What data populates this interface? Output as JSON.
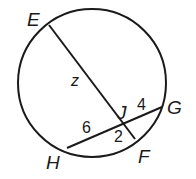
{
  "diagram": {
    "type": "circle-intersecting-chords",
    "points": {
      "E": {
        "label": "E",
        "x": 49,
        "y": 25
      },
      "F": {
        "label": "F",
        "x": 135,
        "y": 139
      },
      "G": {
        "label": "G",
        "x": 162,
        "y": 107
      },
      "H": {
        "label": "H",
        "x": 67,
        "y": 148
      },
      "J": {
        "label": "J",
        "x": 124,
        "y": 124
      }
    },
    "chords": [
      "EF",
      "HG"
    ],
    "segment_labels": {
      "EJ": "z",
      "JF": "2",
      "HJ": "6",
      "JG": "4"
    },
    "colors": {
      "stroke": "#1a1a1a",
      "background": "#ffffff"
    }
  }
}
